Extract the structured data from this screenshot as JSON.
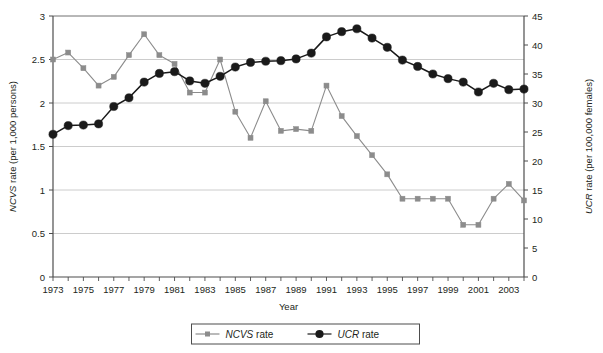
{
  "chart_data": {
    "type": "line",
    "title": "",
    "xlabel": "Year",
    "ylabel": "NCVS rate (per 1,000 persons)",
    "y2label": "UCR rate (per 100,000 females)",
    "x": [
      1973,
      1974,
      1975,
      1976,
      1977,
      1978,
      1979,
      1980,
      1981,
      1982,
      1983,
      1984,
      1985,
      1986,
      1987,
      1988,
      1989,
      1990,
      1991,
      1992,
      1993,
      1994,
      1995,
      1996,
      1997,
      1998,
      1999,
      2000,
      2001,
      2002,
      2003,
      2004
    ],
    "xlim": [
      1973,
      2004
    ],
    "xtick_labels": [
      "1973",
      "1975",
      "1977",
      "1979",
      "1981",
      "1983",
      "1985",
      "1987",
      "1989",
      "1991",
      "1993",
      "1995",
      "1997",
      "1999",
      "2001",
      "2003"
    ],
    "xtick_values": [
      1973,
      1975,
      1977,
      1979,
      1981,
      1983,
      1985,
      1987,
      1989,
      1991,
      1993,
      1995,
      1997,
      1999,
      2001,
      2003
    ],
    "ylim": [
      0,
      3
    ],
    "ytick_values": [
      0,
      0.5,
      1,
      1.5,
      2,
      2.5,
      3
    ],
    "ytick_labels": [
      "0",
      "0.5",
      "1",
      "1.5",
      "2",
      "2.5",
      "3"
    ],
    "y2lim": [
      0,
      45
    ],
    "y2tick_values": [
      0,
      5,
      10,
      15,
      20,
      25,
      30,
      35,
      40,
      45
    ],
    "y2tick_labels": [
      "0",
      "5",
      "10",
      "15",
      "20",
      "25",
      "30",
      "35",
      "40",
      "45"
    ],
    "grid": true,
    "legend_position": "bottom",
    "series": [
      {
        "name": "NCVS rate",
        "axis": "left",
        "color": "#8c8c8c",
        "marker": "square",
        "values": [
          2.5,
          2.58,
          2.4,
          2.2,
          2.3,
          2.55,
          2.79,
          2.55,
          2.45,
          2.12,
          2.12,
          2.5,
          1.9,
          1.6,
          2.02,
          1.68,
          1.7,
          1.68,
          2.2,
          1.85,
          1.62,
          1.4,
          1.18,
          0.9,
          0.9,
          0.9,
          0.9,
          0.6,
          0.6,
          0.9,
          1.07,
          0.88
        ]
      },
      {
        "name": "UCR rate",
        "axis": "right",
        "color": "#1a1a1a",
        "marker": "circle",
        "values": [
          24.6,
          26.1,
          26.2,
          26.4,
          29.4,
          30.9,
          33.6,
          35.1,
          35.4,
          33.8,
          33.4,
          34.6,
          36.2,
          37.0,
          37.2,
          37.3,
          37.6,
          38.6,
          41.4,
          42.3,
          42.8,
          41.2,
          39.6,
          37.4,
          36.3,
          35.0,
          34.2,
          33.6,
          31.9,
          33.4,
          32.3,
          32.4
        ]
      }
    ]
  },
  "legend": {
    "items": [
      {
        "label_italic": "NCVS",
        "label_rest": " rate",
        "marker": "square",
        "color": "#8c8c8c"
      },
      {
        "label_italic": "UCR",
        "label_rest": " rate",
        "marker": "circle",
        "color": "#1a1a1a"
      }
    ]
  },
  "axes": {
    "left_title_italic": "NCVS",
    "left_title_rest": " rate (per 1,000 persons)",
    "right_title_italic": "UCR",
    "right_title_rest": " rate (per 100,000 females)",
    "x_title": "Year"
  }
}
